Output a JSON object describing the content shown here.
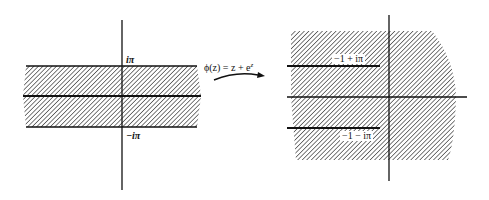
{
  "diagram": {
    "type": "conformal-mapping",
    "left_panel": {
      "description": "horizontal strip -pi < Im z < pi",
      "labels": {
        "top": "iπ",
        "bottom": "−iπ"
      }
    },
    "mapping": {
      "label": "ϕ(z) = z + e",
      "exponent": "z"
    },
    "right_panel": {
      "description": "plane minus two horizontal slits ending at -1 ± iπ",
      "labels": {
        "upper_slit": "−1 + iπ",
        "lower_slit": "−1 − iπ"
      }
    },
    "colors": {
      "ink": "#111111",
      "hatch": "#333333",
      "background": "#ffffff"
    }
  }
}
